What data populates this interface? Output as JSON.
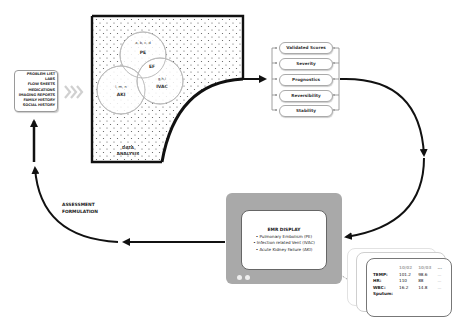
{
  "diagram": {
    "title": "",
    "sources": {
      "items": [
        "PROBLEM LIST",
        "LABS",
        "FLOW SHEETS",
        "MEDICATIONS",
        "IMAGING REPORTS",
        "FAMILY HISTORY",
        "SOCIAL HISTORY"
      ]
    },
    "transition_icon": "triple-chevron-right-icon",
    "data_analysis": {
      "label_line1": "DATA",
      "label_line2": "ANALYSIS",
      "venn": {
        "pe": {
          "vars": "a, b, c, d",
          "name": "PE"
        },
        "ef": {
          "name": "EF"
        },
        "ivac": {
          "vars": "g,h,i",
          "name": "IVAC"
        },
        "aki": {
          "vars": "l, m, n",
          "name": "AKI"
        }
      }
    },
    "criteria": [
      "Validated Scores",
      "Severity",
      "Prognostics",
      "Reversibility",
      "Stability"
    ],
    "emr_display": {
      "title": "EMR DISPLAY",
      "items": [
        "• Pulmonary Embolism (PE)",
        "• Infection related Vent (IVAC)",
        "• Acute Kidney Failure (AKI)"
      ]
    },
    "vitals_card": {
      "columns": [
        "10/02",
        "10/03",
        "..."
      ],
      "rows": [
        {
          "label": "TEMP:",
          "values": [
            "101.2",
            "98.6",
            "..."
          ]
        },
        {
          "label": "HR:",
          "values": [
            "110",
            "88",
            "..."
          ]
        },
        {
          "label": "WBC:",
          "values": [
            "16.2",
            "14.8",
            "..."
          ]
        },
        {
          "label": "Sputum:",
          "values": [
            "",
            "",
            ""
          ]
        }
      ]
    },
    "assessment": {
      "line1": "ASSESSMENT",
      "line2": "FORMULATION"
    },
    "colors": {
      "stroke": "#111111",
      "monitor": "#a9a9a9",
      "chevrons": "#d0d0d0",
      "venn_circles": "#b8b8b8",
      "dots": "#555555"
    }
  }
}
